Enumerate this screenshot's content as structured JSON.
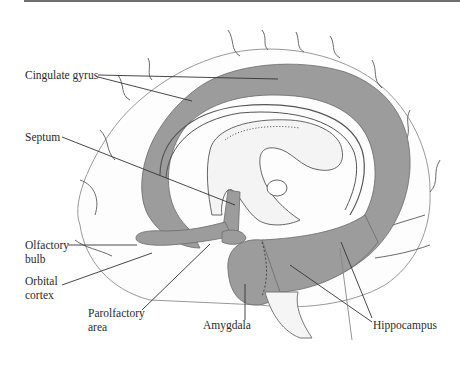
{
  "figure": {
    "type": "anatomical-diagram",
    "colors": {
      "limbic_fill": "#9c9c9c",
      "outline": "#6a6a6a",
      "background": "#ffffff",
      "label_text": "#2a2a2a"
    }
  },
  "labels": {
    "cingulate_gyrus": "Cingulate gyrus",
    "septum": "Septum",
    "olfactory_bulb_line1": "Olfactory",
    "olfactory_bulb_line2": "bulb",
    "orbital_cortex_line1": "Orbital",
    "orbital_cortex_line2": "cortex",
    "parolfactory_area_line1": "Parolfactory",
    "parolfactory_area_line2": "area",
    "amygdala": "Amygdala",
    "hippocampus": "Hippocampus"
  }
}
